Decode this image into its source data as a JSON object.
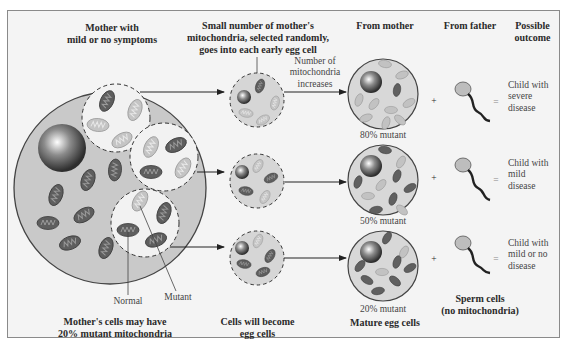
{
  "headers": {
    "mother": "Mother with\nmild or no symptoms",
    "selection": "Small number of mother's\nmitochondria, selected randomly,\ngoes into each early egg cell",
    "from_mother": "From mother",
    "from_father": "From father",
    "outcome": "Possible\noutcome"
  },
  "annotations": {
    "increase": "Number of\nmitochondria\nincreases",
    "normal": "Normal",
    "mutant": "Mutant"
  },
  "rows": [
    {
      "mutant_pct": "80% mutant",
      "operator_plus": "+",
      "operator_eq": "=",
      "outcome": "Child with\nsevere\ndisease"
    },
    {
      "mutant_pct": "50% mutant",
      "operator_plus": "+",
      "operator_eq": "=",
      "outcome": "Child with\nmild\ndisease"
    },
    {
      "mutant_pct": "20% mutant",
      "operator_plus": "+",
      "operator_eq": "=",
      "outcome": "Child with\nmild or no\ndisease"
    }
  ],
  "footers": {
    "mother_cells": "Mother's cells may have\n20% mutant mitochondria",
    "egg_precursors": "Cells will become\negg cells",
    "mature_eggs": "Mature egg cells",
    "sperm": "Sperm cells\n(no mitochondria)"
  },
  "colors": {
    "cell_fill": "#c9c9c9",
    "normal_mito": "#5e5e5e",
    "mutant_mito": "#bdbdbd",
    "background": "#f4f4f4",
    "outline": "#4a4a4a"
  }
}
